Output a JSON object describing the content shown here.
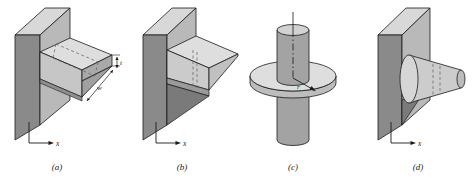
{
  "figure": {
    "background_color": "#ffffff",
    "panels": [
      {
        "id": "a",
        "caption": "(a)",
        "description": "straight rectangular fin on a plane wall",
        "axis_label": "x",
        "dimension_labels": [
          {
            "name": "t",
            "text": "t",
            "meaning": "fin thickness"
          },
          {
            "name": "w",
            "text": "w",
            "meaning": "fin width"
          }
        ]
      },
      {
        "id": "b",
        "caption": "(b)",
        "description": "straight triangular (tapered) fin on a plane wall",
        "axis_label": "x",
        "dimension_labels": []
      },
      {
        "id": "c",
        "caption": "(c)",
        "description": "annular fin on a cylindrical tube",
        "axis_label": "",
        "dimension_labels": [
          {
            "name": "r",
            "text": "r",
            "meaning": "radial coordinate"
          }
        ]
      },
      {
        "id": "d",
        "caption": "(d)",
        "description": "pin fin of non-uniform cross section on a plane wall",
        "axis_label": "x",
        "dimension_labels": []
      }
    ],
    "colors": {
      "line": "#1a1a1a",
      "wall_side_dark": "#8a8a8a",
      "wall_face_mid": "#b4b4b4",
      "wall_top_light": "#d8d8d8",
      "fin_top_light": "#dcdcdc",
      "fin_front_mid": "#c2c2c2",
      "fin_end_dark": "#a6a6a6",
      "shadow_dark": "#7d7d7d",
      "cylinder_mid": "#a8a8a8",
      "disk_light": "#dcdcdc",
      "disk_edge_mid": "#bdbdbd",
      "hidden_line": "#6e6e6e"
    }
  }
}
